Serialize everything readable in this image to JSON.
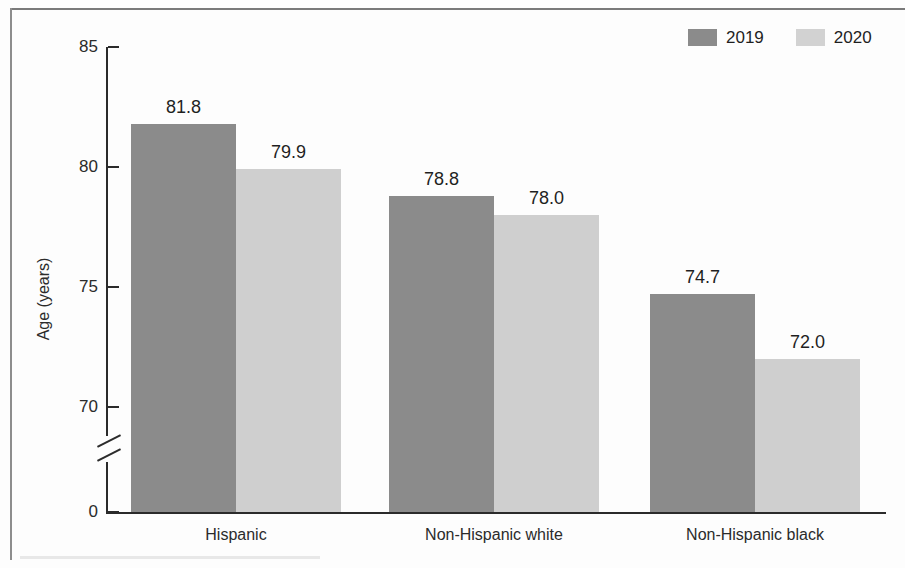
{
  "chart_data": {
    "type": "bar",
    "title": "",
    "xlabel": "",
    "ylabel": "Age (years)",
    "categories": [
      "Hispanic",
      "Non-Hispanic white",
      "Non-Hispanic black"
    ],
    "series": [
      {
        "name": "2019",
        "color": "#8b8b8b",
        "values": [
          81.8,
          78.8,
          74.7
        ]
      },
      {
        "name": "2020",
        "color": "#cfcfcf",
        "values": [
          79.9,
          78.0,
          72.0
        ]
      }
    ],
    "value_labels": [
      [
        "81.8",
        "79.9"
      ],
      [
        "78.8",
        "78.0"
      ],
      [
        "74.7",
        "72.0"
      ]
    ],
    "ytick_labels": [
      "85",
      "80",
      "75",
      "70",
      "0"
    ],
    "ytick_values": [
      85,
      80,
      75,
      70,
      0
    ],
    "ylim": [
      69,
      85
    ],
    "axis_break": true,
    "grid": false,
    "legend_position": "top-right"
  },
  "axis": {
    "y_title": "Age (years)",
    "ticks": [
      {
        "label": "85",
        "value": 85
      },
      {
        "label": "80",
        "value": 80
      },
      {
        "label": "75",
        "value": 75
      },
      {
        "label": "70",
        "value": 70
      },
      {
        "label": "0",
        "value": 0
      }
    ]
  },
  "legend": {
    "items": [
      {
        "label": "2019",
        "color": "#8b8b8b"
      },
      {
        "label": "2020",
        "color": "#cfcfcf"
      }
    ]
  }
}
